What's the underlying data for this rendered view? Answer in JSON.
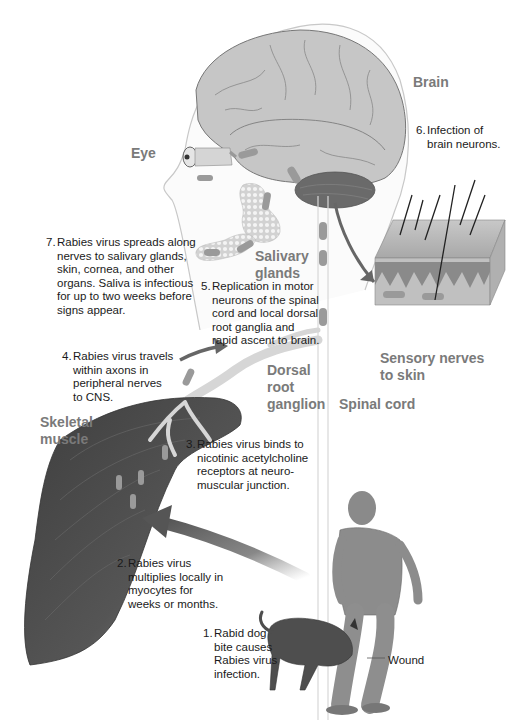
{
  "labels": {
    "brain": "Brain",
    "eye": "Eye",
    "salivary_glands": "Salivary\nglands",
    "sensory_nerves": "Sensory nerves\nto skin",
    "dorsal_root_ganglion": "Dorsal\nroot\nganglion",
    "spinal_cord": "Spinal cord",
    "skeletal_muscle": "Skeletal\nmuscle",
    "wound": "Wound"
  },
  "steps": [
    {
      "num": "1.",
      "text": "Rabid dog\nbite causes\nRabies virus\ninfection."
    },
    {
      "num": "2.",
      "text": "Rabies virus\nmultiplies locally in\nmyocytes for\nweeks or months."
    },
    {
      "num": "3.",
      "text": "Rabies virus binds to\nnicotinic acetylcholine\nreceptors at neuro-\nmuscular junction."
    },
    {
      "num": "4.",
      "text": "Rabies virus travels\nwithin axons in\nperipheral nerves\nto CNS."
    },
    {
      "num": "5.",
      "text": "Replication in motor\nneurons of the spinal\ncord and local dorsal\nroot ganglia and\nrapid ascent to brain."
    },
    {
      "num": "6.",
      "text": "Infection of\nbrain neurons."
    },
    {
      "num": "7.",
      "text": "Rabies virus spreads along\nnerves to  salivary glands,\nskin, cornea, and other\norgans. Saliva is infectious\nfor up to two weeks before\nsigns appear."
    }
  ],
  "colors": {
    "label_gray": "#7a7a7a",
    "text_dark": "#1a1a1a",
    "brain_fill": "#c4c4c4",
    "cerebellum": "#6a6a6a",
    "muscle": "#4a4a4a",
    "virus": "#9a9a9a",
    "arrow": "#5f5f5f"
  }
}
